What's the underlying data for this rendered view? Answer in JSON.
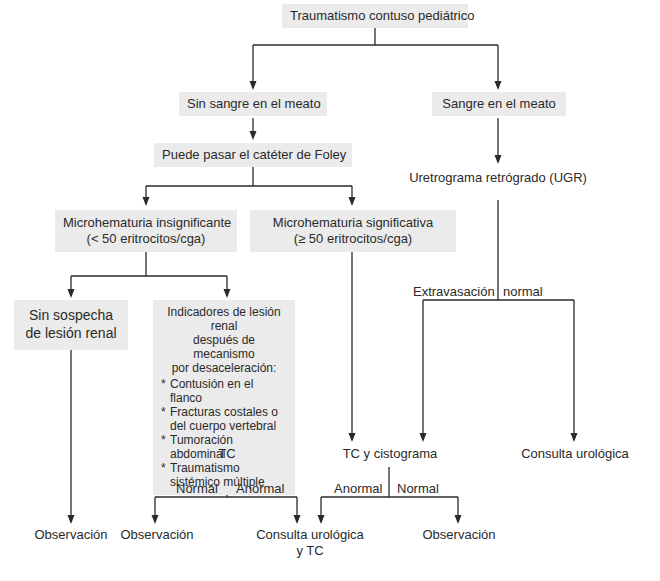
{
  "diagram": {
    "type": "flowchart",
    "title": "Traumatismo contuso pediátrico",
    "nodes": {
      "root": "Traumatismo contuso pediátrico",
      "no_blood": "Sin sangre en el meato",
      "blood": "Sangre en el meato",
      "foley": "Puede pasar el catéter de Foley",
      "ugr": "Uretrograma retrógrado (UGR)",
      "micro_insig_line1": "Microhematuria insignificante",
      "micro_insig_line2": "(< 50 eritrocitos/cga)",
      "micro_sig_line1": "Microhematuria significativa",
      "micro_sig_line2": "(≥ 50 eritrocitos/cga)",
      "no_suspicion_line1": "Sin sospecha",
      "no_suspicion_line2": "de lesión renal",
      "indicators": {
        "head_line1": "Indicadores de lesión renal",
        "head_line2": "después de mecanismo",
        "head_line3": "por desaceleración:",
        "items": [
          "Contusión en el flanco",
          "Fracturas costales o del cuerpo vertebral",
          "Tumoración abdominal",
          "Traumatismo sistémico múltiple"
        ]
      },
      "ct": "TC",
      "ct_cysto": "TC y cistograma",
      "uro_consult_right": "Consulta urológica",
      "observation_1": "Observación",
      "observation_2": "Observación",
      "uro_consult_ct_line1": "Consulta urológica",
      "uro_consult_ct_line2": "y TC",
      "observation_3": "Observación"
    },
    "edge_labels": {
      "extravasation": "Extravasación",
      "ugr_normal": "normal",
      "ct_normal": "Normal",
      "ct_abnormal": "Anormal",
      "cysto_abnormal": "Anormal",
      "cysto_normal": "Normal"
    },
    "colors": {
      "box_fill": "#ebebeb",
      "line": "#2a2a2a",
      "background": "#ffffff"
    }
  }
}
